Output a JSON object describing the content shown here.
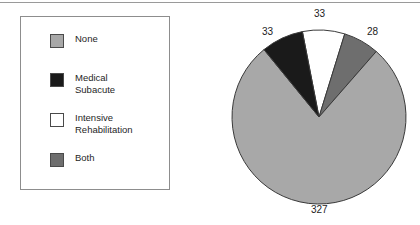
{
  "figure": {
    "background_color": "#ffffff",
    "rule_color": "#9a9a9a"
  },
  "legend": {
    "border_color": "#8d8d8d",
    "items": [
      {
        "label": "None",
        "swatch_color": "#a8a8a8",
        "swatch_name": "legend-swatch-none"
      },
      {
        "label": "Medical\nSubacute",
        "swatch_color": "#1a1a1a",
        "swatch_name": "legend-swatch-medical-subacute"
      },
      {
        "label": "Intensive\nRehabilitation",
        "swatch_color": "#ffffff",
        "swatch_name": "legend-swatch-intensive-rehabilitation"
      },
      {
        "label": "Both",
        "swatch_color": "#6e6e6e",
        "swatch_name": "legend-swatch-both"
      }
    ]
  },
  "chart_data": {
    "type": "pie",
    "title": "",
    "xlabel": "",
    "ylabel": "",
    "total": 421,
    "start_angle_deg": -11,
    "direction": "clockwise",
    "outline_color": "#3a3a3a",
    "categories": [
      "Intensive Rehabilitation",
      "Both",
      "None",
      "Medical Subacute"
    ],
    "values": [
      33,
      28,
      327,
      33
    ],
    "colors": [
      "#ffffff",
      "#6e6e6e",
      "#a8a8a8",
      "#1a1a1a"
    ],
    "slices": [
      {
        "name": "Intensive Rehabilitation",
        "value": 33,
        "color": "#ffffff",
        "percent": 7.8,
        "label": "33"
      },
      {
        "name": "Both",
        "value": 28,
        "color": "#6e6e6e",
        "percent": 6.7,
        "label": "28"
      },
      {
        "name": "None",
        "value": 327,
        "color": "#a8a8a8",
        "percent": 77.7,
        "label": "327"
      },
      {
        "name": "Medical Subacute",
        "value": 33,
        "color": "#1a1a1a",
        "percent": 7.8,
        "label": "33"
      }
    ],
    "data_labels": [
      {
        "text": "33",
        "for": "Intensive Rehabilitation",
        "x": 104,
        "y": 8
      },
      {
        "text": "28",
        "for": "Both",
        "x": 157,
        "y": 26
      },
      {
        "text": "33",
        "for": "Medical Subacute",
        "x": 52,
        "y": 26
      },
      {
        "text": "327",
        "for": "None",
        "x": 101,
        "y": 204
      }
    ],
    "legend_position": "left",
    "grid": false
  }
}
